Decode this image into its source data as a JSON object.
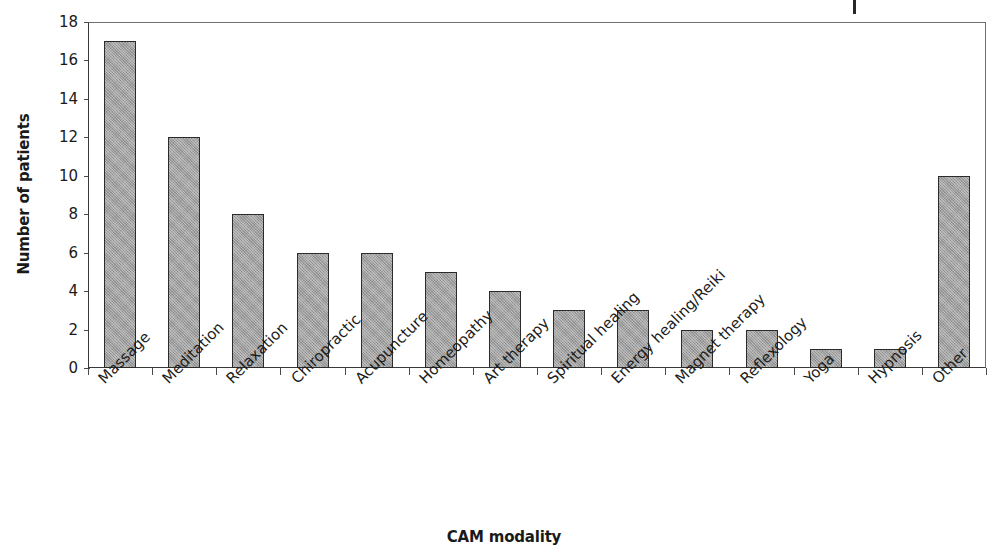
{
  "chart_data": {
    "type": "bar",
    "title": "",
    "subtitle": "",
    "xlabel": "CAM modality",
    "ylabel": "Number of patients",
    "categories": [
      "Massage",
      "Meditation",
      "Relaxation",
      "Chiropractic",
      "Acupuncture",
      "Homeopathy",
      "Art therapy",
      "Spiritual healing",
      "Energy healing/Reiki",
      "Magnet therapy",
      "Reflexology",
      "Yoga",
      "Hypnosis",
      "Other"
    ],
    "values": [
      17,
      12,
      8,
      6,
      6,
      5,
      4,
      3,
      3,
      2,
      2,
      1,
      1,
      10
    ],
    "ylim": [
      0,
      18
    ],
    "ytick_step": 2,
    "yticks": [
      0,
      2,
      4,
      6,
      8,
      10,
      12,
      14,
      16,
      18
    ],
    "ytick_labels": [
      "0",
      "2",
      "4",
      "6",
      "8",
      "10",
      "12",
      "14",
      "16",
      "18"
    ],
    "grid": false,
    "legend": false,
    "legend_position": "none",
    "bar_color": "#a0a0a0",
    "bar_edge_color": "#2b2b2b",
    "axis_color": "#3a3a3a",
    "background_color": "#ffffff",
    "xtick_label_rotation": -45
  },
  "artifact": {
    "name": "scan-mark"
  }
}
